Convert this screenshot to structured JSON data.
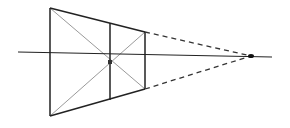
{
  "diagram": {
    "title": "",
    "type": "one-point perspective frustum sketch",
    "colors": {
      "background": "#ffffff",
      "stroke": "#222222",
      "diagonal": "#9a9a9a",
      "dashed": "#333333",
      "point": "#111111"
    },
    "points": {
      "near_top_left": [
        50,
        8
      ],
      "near_bottom_left": [
        50,
        116
      ],
      "mid_top": [
        110,
        23
      ],
      "mid_bottom": [
        110,
        100
      ],
      "far_top_right": [
        145,
        32
      ],
      "far_bottom_right": [
        145,
        89
      ],
      "center": [
        110,
        62
      ],
      "vanishing_point": [
        251,
        56
      ]
    },
    "horizon": {
      "start": [
        18,
        52
      ],
      "end": [
        272,
        57
      ]
    }
  }
}
